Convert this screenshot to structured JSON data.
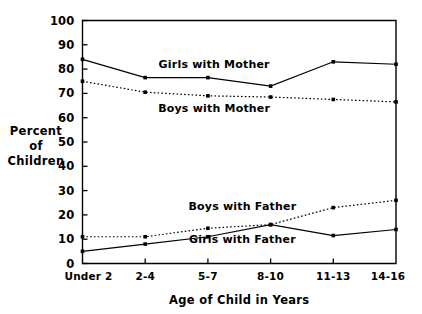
{
  "chart_data": {
    "type": "line",
    "title": "",
    "xlabel": "Age of Child in Years",
    "ylabel": "Percent of Children",
    "ylabel_lines": [
      "Percent",
      "of",
      "Children"
    ],
    "categories": [
      "Under 2",
      "2-4",
      "5-7",
      "8-10",
      "11-13",
      "14-16"
    ],
    "ylim": [
      0,
      100
    ],
    "yticks": [
      0,
      10,
      20,
      30,
      40,
      50,
      60,
      70,
      80,
      90,
      100
    ],
    "ytick_labels": [
      "0",
      "10",
      "20",
      "30",
      "40",
      "50",
      "60",
      "70",
      "80",
      "90",
      "100"
    ],
    "grid": false,
    "legend": "inline-labels",
    "series": [
      {
        "name": "Girls with Mother",
        "style": "solid",
        "values": [
          84,
          76.5,
          76.5,
          73,
          83,
          82
        ]
      },
      {
        "name": "Boys with Mother",
        "style": "dotted",
        "values": [
          75,
          70.5,
          69,
          68.5,
          67.5,
          66.5
        ]
      },
      {
        "name": "Boys with Father",
        "style": "dotted",
        "values": [
          11,
          11,
          14.5,
          16,
          23,
          26
        ]
      },
      {
        "name": "Girls with Father",
        "style": "solid",
        "values": [
          5,
          8,
          11,
          16,
          11.5,
          14
        ]
      }
    ],
    "annotations": [
      {
        "text": "Girls with Mother",
        "x_cat_index": 2.1,
        "y_value": 80.5
      },
      {
        "text": "Boys with Mother",
        "x_cat_index": 2.1,
        "y_value": 62.5
      },
      {
        "text": "Boys with Father",
        "x_cat_index": 2.55,
        "y_value": 22.0
      },
      {
        "text": "Girls with Father",
        "x_cat_index": 2.55,
        "y_value": 8.5
      }
    ]
  },
  "colors": {
    "ink": "#000000",
    "background": "#ffffff"
  }
}
